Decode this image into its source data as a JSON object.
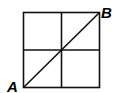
{
  "diagram": {
    "type": "2x2 grid with diagonal",
    "labels": {
      "a": "A",
      "b": "B"
    },
    "line_color": "#000000",
    "grid": {
      "rows": 2,
      "cols": 2
    }
  }
}
